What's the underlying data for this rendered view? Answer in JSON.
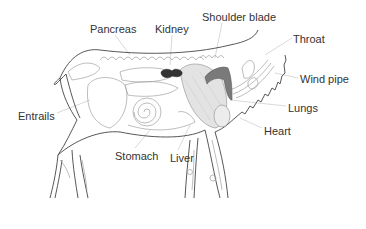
{
  "diagram": {
    "labels": [
      {
        "id": "pancreas",
        "text": "Pancreas",
        "x": 90,
        "y": 23
      },
      {
        "id": "kidney",
        "text": "Kidney",
        "x": 155,
        "y": 23
      },
      {
        "id": "shoulder-blade",
        "text": "Shoulder blade",
        "x": 202,
        "y": 11
      },
      {
        "id": "throat",
        "text": "Throat",
        "x": 293,
        "y": 33
      },
      {
        "id": "wind-pipe",
        "text": "Wind pipe",
        "x": 300,
        "y": 73
      },
      {
        "id": "lungs",
        "text": "Lungs",
        "x": 288,
        "y": 102
      },
      {
        "id": "heart",
        "text": "Heart",
        "x": 264,
        "y": 125
      },
      {
        "id": "entrails",
        "text": "Entrails",
        "x": 18,
        "y": 110
      },
      {
        "id": "stomach",
        "text": "Stomach",
        "x": 115,
        "y": 150
      },
      {
        "id": "liver",
        "text": "Liver",
        "x": 170,
        "y": 152
      }
    ],
    "colors": {
      "outline": "#444444",
      "organ_outline": "#9a9a9a",
      "kidney_fill": "#333333",
      "lung_fill": "#e2e2e2",
      "throat_fill": "#777777",
      "leader_line": "#cccccc",
      "label_text": "#333333"
    }
  }
}
